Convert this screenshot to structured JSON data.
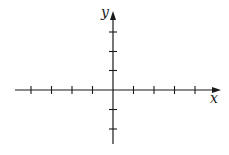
{
  "diagram": {
    "type": "cartesian-coordinate-axes",
    "x_axis": {
      "label": "x",
      "arrow": "positive-direction",
      "ticks_negative": 4,
      "ticks_positive": 4
    },
    "y_axis": {
      "label": "y",
      "arrow": "positive-direction",
      "ticks_positive": 3,
      "ticks_negative": 2
    },
    "colors": {
      "stroke": "#1a1a1a",
      "background": "#ffffff"
    }
  }
}
